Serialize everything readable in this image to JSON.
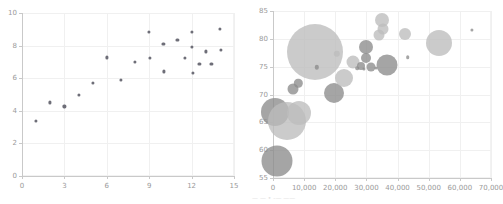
{
  "figure": {
    "background": "#ffffff",
    "width": 499,
    "height": 204,
    "caption": "— — • -— ——"
  },
  "chart_data": [
    {
      "id": "left-scatter",
      "type": "scatter",
      "title": "",
      "xlabel": "",
      "ylabel": "",
      "xlim": [
        0,
        15
      ],
      "ylim": [
        0,
        10
      ],
      "xticks": [
        0,
        3,
        6,
        9,
        12,
        15
      ],
      "xticklabels": [
        "0",
        "3",
        "6",
        "9",
        "12",
        "15"
      ],
      "yticks": [
        0,
        2,
        4,
        6,
        8,
        10
      ],
      "yticklabels": [
        "0",
        "2",
        "4",
        "6",
        "8",
        "10"
      ],
      "grid": true,
      "legend": "none",
      "marker_color": "#6e6e78",
      "marker_size_px": 3.2,
      "points": [
        {
          "x": 1.0,
          "y": 3.38
        },
        {
          "x": 2.0,
          "y": 4.52
        },
        {
          "x": 3.0,
          "y": 4.27
        },
        {
          "x": 4.0,
          "y": 5.0
        },
        {
          "x": 5.0,
          "y": 5.72
        },
        {
          "x": 6.0,
          "y": 7.28
        },
        {
          "x": 7.0,
          "y": 5.88
        },
        {
          "x": 8.0,
          "y": 7.0
        },
        {
          "x": 9.0,
          "y": 8.82
        },
        {
          "x": 9.05,
          "y": 7.24
        },
        {
          "x": 10.0,
          "y": 8.08
        },
        {
          "x": 10.05,
          "y": 6.42
        },
        {
          "x": 11.0,
          "y": 8.34
        },
        {
          "x": 11.5,
          "y": 7.26
        },
        {
          "x": 12.0,
          "y": 8.86
        },
        {
          "x": 12.05,
          "y": 7.92
        },
        {
          "x": 12.1,
          "y": 6.3
        },
        {
          "x": 12.55,
          "y": 6.88
        },
        {
          "x": 13.0,
          "y": 7.64
        },
        {
          "x": 13.4,
          "y": 6.88
        },
        {
          "x": 14.0,
          "y": 9.0
        },
        {
          "x": 14.05,
          "y": 7.74
        }
      ]
    },
    {
      "id": "right-bubble",
      "type": "scatter",
      "title": "",
      "xlabel": "",
      "ylabel": "",
      "xlim": [
        0,
        70000
      ],
      "ylim": [
        55,
        85
      ],
      "xticks": [
        0,
        10000,
        20000,
        30000,
        40000,
        50000,
        60000,
        70000
      ],
      "xticklabels": [
        "0",
        "10,000",
        "20,000",
        "30,000",
        "40,000",
        "50,000",
        "60,000",
        "70,000"
      ],
      "yticks": [
        55,
        60,
        65,
        70,
        75,
        80,
        85
      ],
      "yticklabels": [
        "55",
        "60",
        "65",
        "70",
        "75",
        "80",
        "85"
      ],
      "grid": true,
      "legend": "none",
      "color_light": "#bdbdbd",
      "color_dark": "#8c8c8c",
      "bubbles": [
        {
          "x": 1200,
          "y": 58.0,
          "r": 15.5,
          "tone": "dark"
        },
        {
          "x": 600,
          "y": 66.9,
          "r": 14.0,
          "tone": "dark"
        },
        {
          "x": 4600,
          "y": 65.3,
          "r": 19.0,
          "tone": "light"
        },
        {
          "x": 8200,
          "y": 66.6,
          "r": 12.0,
          "tone": "light"
        },
        {
          "x": 6500,
          "y": 71.0,
          "r": 5.5,
          "tone": "dark"
        },
        {
          "x": 8100,
          "y": 72.0,
          "r": 4.2,
          "tone": "dark"
        },
        {
          "x": 13500,
          "y": 77.6,
          "r": 28.0,
          "tone": "light"
        },
        {
          "x": 14100,
          "y": 74.9,
          "r": 2.2,
          "tone": "dark"
        },
        {
          "x": 19600,
          "y": 70.2,
          "r": 10.0,
          "tone": "dark"
        },
        {
          "x": 20500,
          "y": 77.3,
          "r": 3.2,
          "tone": "light"
        },
        {
          "x": 22900,
          "y": 73.0,
          "r": 9.0,
          "tone": "light"
        },
        {
          "x": 25600,
          "y": 75.9,
          "r": 6.5,
          "tone": "light"
        },
        {
          "x": 27000,
          "y": 74.7,
          "r": 1.8,
          "tone": "dark"
        },
        {
          "x": 28300,
          "y": 75.1,
          "r": 4.0,
          "tone": "dark"
        },
        {
          "x": 29100,
          "y": 74.6,
          "r": 1.6,
          "tone": "dark"
        },
        {
          "x": 29800,
          "y": 78.6,
          "r": 7.0,
          "tone": "dark"
        },
        {
          "x": 29900,
          "y": 76.5,
          "r": 5.0,
          "tone": "dark"
        },
        {
          "x": 31600,
          "y": 74.9,
          "r": 4.5,
          "tone": "dark"
        },
        {
          "x": 33100,
          "y": 74.8,
          "r": 1.6,
          "tone": "dark"
        },
        {
          "x": 34000,
          "y": 80.6,
          "r": 5.5,
          "tone": "light"
        },
        {
          "x": 34900,
          "y": 83.3,
          "r": 7.0,
          "tone": "light"
        },
        {
          "x": 35400,
          "y": 81.7,
          "r": 5.5,
          "tone": "light"
        },
        {
          "x": 36600,
          "y": 75.3,
          "r": 10.5,
          "tone": "dark"
        },
        {
          "x": 42400,
          "y": 80.9,
          "r": 6.0,
          "tone": "light"
        },
        {
          "x": 43300,
          "y": 76.7,
          "r": 1.8,
          "tone": "dark"
        },
        {
          "x": 53300,
          "y": 79.2,
          "r": 13.0,
          "tone": "light"
        },
        {
          "x": 63900,
          "y": 81.6,
          "r": 1.6,
          "tone": "dark"
        }
      ]
    }
  ]
}
